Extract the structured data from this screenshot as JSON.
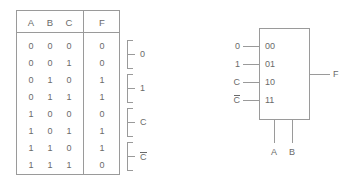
{
  "diagram": {
    "title_text": "",
    "stroke_color": "#9a9a9a",
    "text_color": "#6a6a6a",
    "background_color": "#ffffff"
  },
  "truth_table": {
    "headers": [
      "A",
      "B",
      "C",
      "F"
    ],
    "rows": [
      {
        "A": "0",
        "B": "0",
        "C": "0",
        "F": "0"
      },
      {
        "A": "0",
        "B": "0",
        "C": "1",
        "F": "0"
      },
      {
        "A": "0",
        "B": "1",
        "C": "0",
        "F": "1"
      },
      {
        "A": "0",
        "B": "1",
        "C": "1",
        "F": "1"
      },
      {
        "A": "1",
        "B": "0",
        "C": "0",
        "F": "0"
      },
      {
        "A": "1",
        "B": "0",
        "C": "1",
        "F": "1"
      },
      {
        "A": "1",
        "B": "1",
        "C": "0",
        "F": "1"
      },
      {
        "A": "1",
        "B": "1",
        "C": "1",
        "F": "0"
      }
    ],
    "group_brackets": [
      {
        "label": "0",
        "overbar": false,
        "rows": [
          0,
          1
        ]
      },
      {
        "label": "1",
        "overbar": false,
        "rows": [
          2,
          3
        ]
      },
      {
        "label": "C",
        "overbar": false,
        "rows": [
          4,
          5
        ]
      },
      {
        "label": "C",
        "overbar": true,
        "rows": [
          6,
          7
        ]
      }
    ]
  },
  "mux": {
    "type": "4-to-1 multiplexer",
    "data_inputs": [
      {
        "signal": "0",
        "overbar": false,
        "select_code": "00"
      },
      {
        "signal": "1",
        "overbar": false,
        "select_code": "01"
      },
      {
        "signal": "C",
        "overbar": false,
        "select_code": "10"
      },
      {
        "signal": "C",
        "overbar": true,
        "select_code": "11"
      }
    ],
    "select_lines": [
      "A",
      "B"
    ],
    "output": "F"
  }
}
